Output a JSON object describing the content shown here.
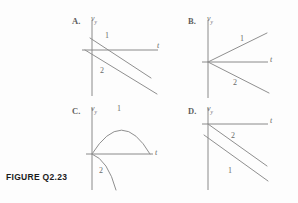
{
  "figure": {
    "caption": "FIGURE Q2.23",
    "background_color": "#fdfdfd",
    "line_color": "#8f8f8f",
    "axis_color": "#8a8a8a",
    "text_color": "#6a6a6a"
  },
  "common": {
    "vertical_axis_label": "v",
    "vertical_axis_subscript": "y",
    "horizontal_axis_label": "t"
  },
  "panels": [
    {
      "letter": "A.",
      "vertical_axis_label": "v",
      "vertical_axis_subscript": "y",
      "horizontal_axis_label": "t",
      "curves": [
        {
          "label": "1",
          "shape": "line",
          "description": "straight line starting above origin on the v-axis, sloping down, crossing the t-axis"
        },
        {
          "label": "2",
          "shape": "line",
          "description": "straight line starting at the origin, sloping down, parallel to line 1"
        }
      ]
    },
    {
      "letter": "B.",
      "vertical_axis_label": "v",
      "vertical_axis_subscript": "y",
      "horizontal_axis_label": "t",
      "curves": [
        {
          "label": "1",
          "shape": "line",
          "description": "straight line from the origin sloping up to the right"
        },
        {
          "label": "2",
          "shape": "line",
          "description": "straight line from the origin sloping down to the right"
        }
      ]
    },
    {
      "letter": "C.",
      "vertical_axis_label": "v",
      "vertical_axis_subscript": "y",
      "horizontal_axis_label": "t",
      "curves": [
        {
          "label": "1",
          "shape": "parabola-arch",
          "description": "inverted parabola from the origin, peaking above the t-axis, returning to the t-axis"
        },
        {
          "label": "2",
          "shape": "curve-down",
          "description": "curve from the origin bending steeply downward below the t-axis"
        }
      ]
    },
    {
      "letter": "D.",
      "vertical_axis_label": "v",
      "vertical_axis_subscript": "y",
      "horizontal_axis_label": "t",
      "curves": [
        {
          "label": "2",
          "shape": "line",
          "description": "straight line starting at the origin, sloping down to the right"
        },
        {
          "label": "1",
          "shape": "line",
          "description": "straight line starting below the origin on the v-axis, sloping down, parallel to line 2"
        }
      ]
    }
  ]
}
